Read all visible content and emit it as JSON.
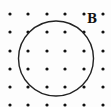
{
  "diagram": {
    "field_label": "B",
    "field_direction": "out-of-page",
    "grid": {
      "columns": 6,
      "rows": 6,
      "x_positions": [
        10,
        28,
        47,
        65,
        84,
        103
      ],
      "y_positions": [
        14,
        32,
        51,
        69,
        87,
        105
      ],
      "dot_radius": 1.6,
      "dot_color": "#111111"
    },
    "circle": {
      "cx": 56,
      "cy": 58.5,
      "r": 37.5,
      "stroke": "#222222",
      "stroke_width": 1.4
    },
    "label_position": {
      "x": 87,
      "y": 13
    }
  }
}
